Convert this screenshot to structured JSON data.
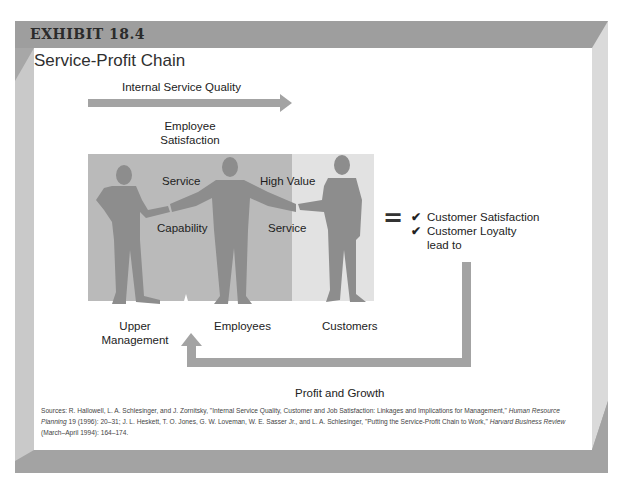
{
  "exhibit": {
    "label": "EXHIBIT 18.4",
    "title": "Service-Profit Chain"
  },
  "diagram": {
    "top_arrow_label": "Internal Service Quality",
    "employee_satisfaction": [
      "Employee",
      "Satisfaction"
    ],
    "figure_labels": {
      "service_top": "Service",
      "capability": "Capability",
      "high_value": "High Value",
      "service_bottom": "Service"
    },
    "people": [
      {
        "label_lines": [
          "Upper",
          "Management"
        ]
      },
      {
        "label_lines": [
          "Employees"
        ]
      },
      {
        "label_lines": [
          "Customers"
        ]
      }
    ],
    "equals_sign": "=",
    "outcomes": [
      {
        "check": "✔",
        "text": "Customer Satisfaction"
      },
      {
        "check": "✔",
        "text": "Customer Loyalty"
      }
    ],
    "outcomes_tail": "lead to",
    "feedback_arrow_label": "Profit and Growth",
    "colors": {
      "frame_gray": "#a6a6a6",
      "frame_light": "#dcdcdc",
      "arrow_gray": "#a3a3a3",
      "silhouette": "#8c8c8c",
      "zone_dark": "#b9b9b9",
      "zone_light": "#e3e3e3"
    }
  },
  "sources": {
    "prefix": "Sources: R. Hallowell, L. A. Schlesinger, and J. Zornitsky, \"Internal Service Quality, Customer and Job Satisfaction: Linkages and Implications for Management,\" ",
    "journal1": "Human Resource Planning",
    "mid": " 19 (1996): 20–31; J. L. Heskett, T. O. Jones, G. W. Loveman, W. E. Sasser Jr., and L. A. Schlesinger, \"Putting the Service-Profit Chain to Work,\" ",
    "journal2": "Harvard Business Review",
    "suffix": " (March–April 1994): 164–174."
  }
}
